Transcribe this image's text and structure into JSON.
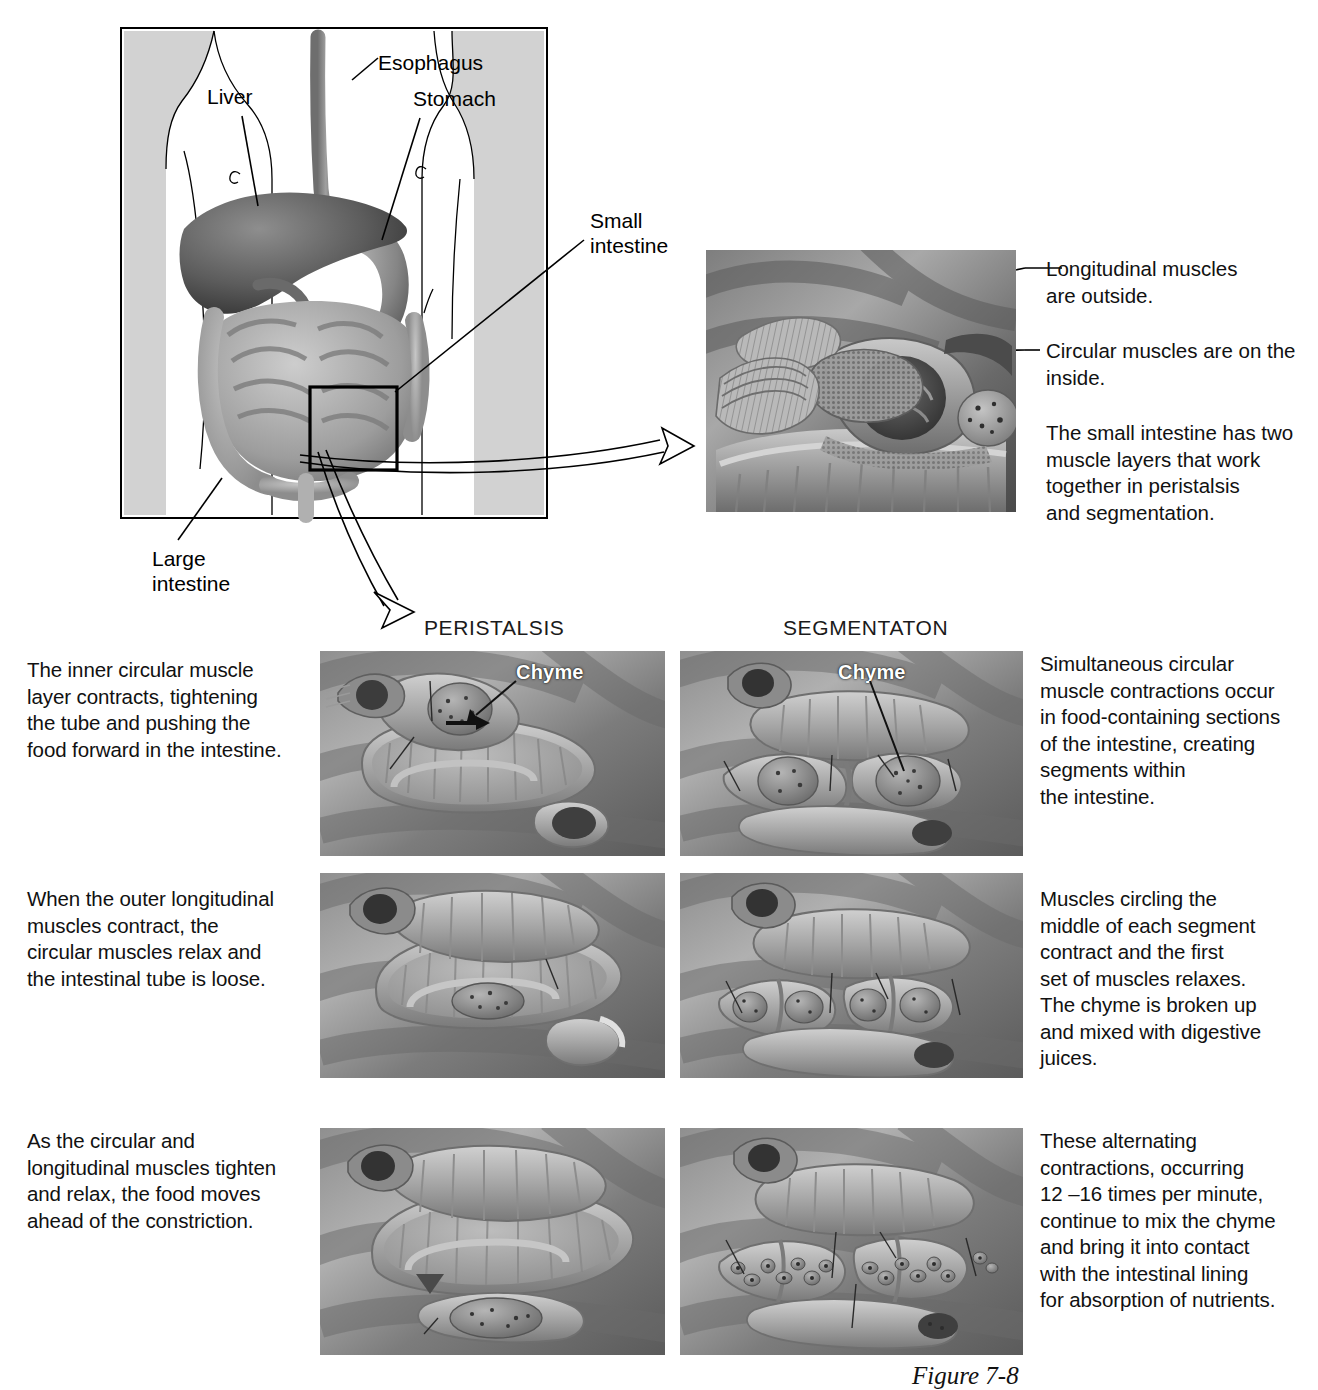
{
  "figure": {
    "caption": "Figure 7-8",
    "anatomy_labels": [
      {
        "id": "esophagus",
        "text": "Esophagus"
      },
      {
        "id": "liver",
        "text": "Liver"
      },
      {
        "id": "stomach",
        "text": "Stomach"
      },
      {
        "id": "small-intestine",
        "text": "Small\nintestine"
      },
      {
        "id": "large-intestine",
        "text": "Large\nintestine"
      }
    ],
    "inset_callouts": [
      {
        "id": "longitudinal",
        "text": "Longitudinal muscles\nare outside.",
        "leader": true
      },
      {
        "id": "circular",
        "text": "Circular muscles are on the\ninside.",
        "leader": true
      },
      {
        "id": "summary",
        "text": "The small intestine has two\nmuscle layers that work\ntogether in peristalsis\nand segmentation.",
        "leader": false
      }
    ],
    "columns": {
      "left_header": "PERISTALSIS",
      "right_header": "SEGMENTATON"
    },
    "chyme_label": "Chyme",
    "rows": [
      {
        "left_text": "The inner circular muscle\nlayer contracts, tightening\nthe tube and pushing the\nfood forward in the intestine.",
        "right_text": "Simultaneous circular\nmuscle contractions occur\nin food-containing sections\nof the intestine, creating\nsegments within\nthe intestine."
      },
      {
        "left_text": "When the outer longitudinal\nmuscles contract, the\ncircular muscles relax and\nthe intestinal tube is loose.",
        "right_text": "Muscles circling the\nmiddle of each segment\ncontract and the first\nset of muscles relaxes.\nThe chyme is broken up\nand mixed with digestive\njuices."
      },
      {
        "left_text": "As the circular and\nlongitudinal muscles tighten\nand relax, the food moves\nahead of the constriction.",
        "right_text": "These alternating\ncontractions, occurring\n12 –16 times per minute,\ncontinue to mix the chyme\nand bring it into contact\nwith the intestinal lining\nfor absorption of nutrients."
      }
    ],
    "colors": {
      "background": "#ffffff",
      "ink": "#000000",
      "body_shade": "#d2d2d2",
      "panel_grey": "#9a9a9a"
    }
  }
}
